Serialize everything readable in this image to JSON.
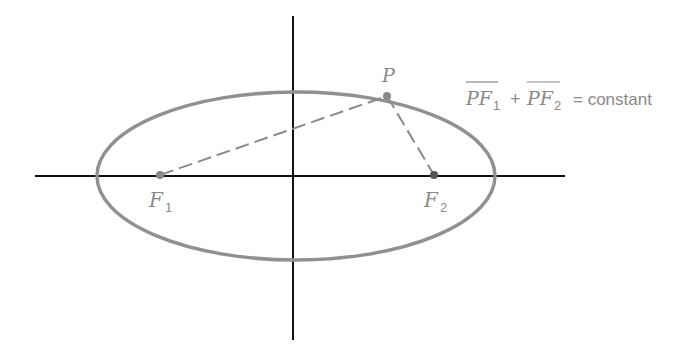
{
  "diagram": {
    "type": "ellipse-foci",
    "colors": {
      "axes": "#111111",
      "ellipse": "#909090",
      "dashed": "#8a8a8a",
      "labels": "#8a8a8a"
    },
    "labels": {
      "point": "P",
      "focus1": "F",
      "focus1_sub": "1",
      "focus2": "F",
      "focus2_sub": "2",
      "equation_term1": "PF",
      "equation_term1_sub": "1",
      "equation_plus": "+",
      "equation_term2": "PF",
      "equation_term2_sub": "2",
      "equation_rhs": "= constant"
    }
  }
}
